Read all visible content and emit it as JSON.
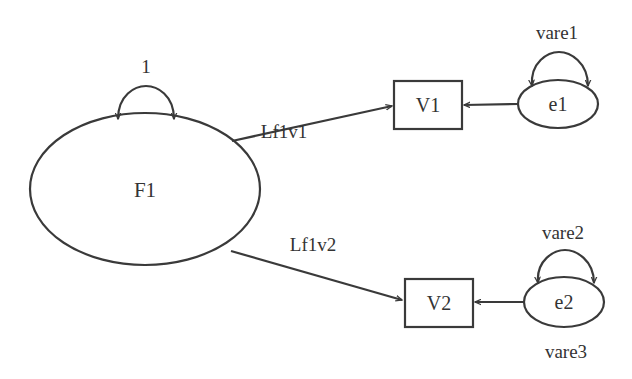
{
  "diagram": {
    "type": "path-diagram",
    "latent": {
      "id": "F1",
      "label": "F1",
      "variance_label": "1"
    },
    "observed": [
      {
        "id": "V1",
        "label": "V1"
      },
      {
        "id": "V2",
        "label": "V2"
      }
    ],
    "errors": [
      {
        "id": "e1",
        "label": "e1",
        "variance_label": "vare1"
      },
      {
        "id": "e2",
        "label": "e2",
        "variance_label": "vare2"
      }
    ],
    "paths": [
      {
        "from": "F1",
        "to": "V1",
        "label": "Lf1v1"
      },
      {
        "from": "F1",
        "to": "V2",
        "label": "Lf1v2"
      },
      {
        "from": "e1",
        "to": "V1",
        "label": ""
      },
      {
        "from": "e2",
        "to": "V2",
        "label": ""
      }
    ],
    "extra_labels": {
      "e2_bottom": "vare3"
    }
  }
}
